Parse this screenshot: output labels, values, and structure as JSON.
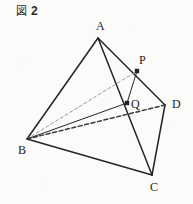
{
  "figure": {
    "caption": {
      "kanji": "図",
      "number": "2"
    },
    "shape_name": "tetrahedron-abcd",
    "background_color": "#fbfbfa",
    "ink_color": "#242424",
    "hidden_edge_color": "#3a3a3a",
    "construction_line_color": "#9a9a9a",
    "vertices": [
      {
        "id": "A",
        "label": "A",
        "x": 98,
        "y": 38,
        "marker": false,
        "label_x": 96,
        "label_y": 30
      },
      {
        "id": "B",
        "label": "B",
        "x": 27,
        "y": 139,
        "marker": false,
        "label_x": 18,
        "label_y": 154
      },
      {
        "id": "C",
        "label": "C",
        "x": 152,
        "y": 175,
        "marker": false,
        "label_x": 150,
        "label_y": 191
      },
      {
        "id": "D",
        "label": "D",
        "x": 165,
        "y": 105,
        "marker": false,
        "label_x": 172,
        "label_y": 108
      },
      {
        "id": "P",
        "label": "P",
        "x": 137,
        "y": 71,
        "marker": true,
        "label_x": 139,
        "label_y": 64
      },
      {
        "id": "Q",
        "label": "Q",
        "x": 127,
        "y": 103,
        "marker": true,
        "label_x": 131,
        "label_y": 108
      }
    ],
    "edges": [
      {
        "id": "AB",
        "from": "A",
        "to": "B",
        "style": "solid",
        "weight": 1.5,
        "hidden": false
      },
      {
        "id": "AC",
        "from": "A",
        "to": "C",
        "style": "solid",
        "weight": 1.5,
        "hidden": false
      },
      {
        "id": "AD",
        "from": "A",
        "to": "D",
        "style": "solid",
        "weight": 1.5,
        "hidden": false
      },
      {
        "id": "BC",
        "from": "B",
        "to": "C",
        "style": "solid",
        "weight": 1.5,
        "hidden": false
      },
      {
        "id": "CD",
        "from": "C",
        "to": "D",
        "style": "solid",
        "weight": 1.5,
        "hidden": false
      },
      {
        "id": "BD",
        "from": "B",
        "to": "D",
        "style": "dashed",
        "weight": 1.5,
        "hidden": true
      },
      {
        "id": "BP",
        "from": "B",
        "to": "P",
        "style": "dashed",
        "weight": 1.0,
        "hidden": true
      },
      {
        "id": "BQ",
        "from": "B",
        "to": "Q",
        "style": "solid",
        "weight": 1.0,
        "hidden": false
      },
      {
        "id": "PQ",
        "from": "P",
        "to": "Q",
        "style": "solid",
        "weight": 1.0,
        "hidden": false
      }
    ],
    "notes": {
      "P_on_edge": "AD",
      "Q_on_edge": "AC"
    }
  }
}
